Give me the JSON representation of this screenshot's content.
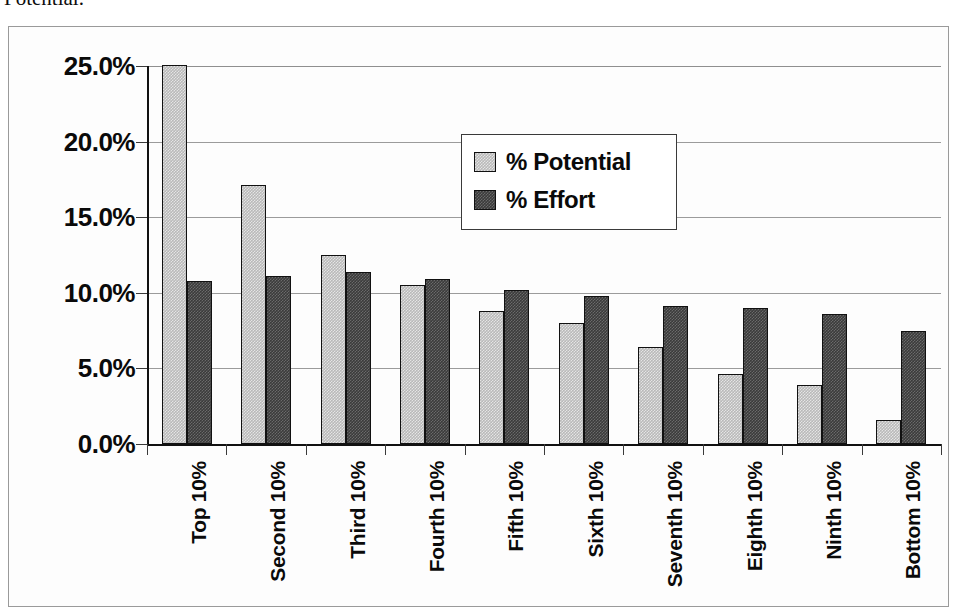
{
  "caption": {
    "text": "Potential."
  },
  "legend": {
    "position": "inside-top-center",
    "entries": [
      {
        "label": "% Potential",
        "color": "#b9b9b9",
        "swatch_name": "legend-swatch-potential"
      },
      {
        "label": "% Effort",
        "color": "#3b3b3b",
        "swatch_name": "legend-swatch-effort"
      }
    ]
  },
  "axis": {
    "y_ticks": [
      "0.0%",
      "5.0%",
      "10.0%",
      "15.0%",
      "20.0%",
      "25.0%"
    ],
    "y_tick_values": [
      0,
      5,
      10,
      15,
      20,
      25
    ]
  },
  "chart_data": {
    "type": "bar",
    "title": "",
    "subtitle": "",
    "xlabel": "",
    "ylabel": "",
    "ylim": [
      0,
      25
    ],
    "ytick_labels": [
      "0.0%",
      "5.0%",
      "10.0%",
      "15.0%",
      "20.0%",
      "25.0%"
    ],
    "ytick_values": [
      0,
      5,
      10,
      15,
      20,
      25
    ],
    "grid": true,
    "grid_axis": "y",
    "legend_position": "inside-top-center",
    "categories": [
      "Top 10%",
      "Second 10%",
      "Third 10%",
      "Fourth 10%",
      "Fifth 10%",
      "Sixth 10%",
      "Seventh 10%",
      "Eighth 10%",
      "Ninth 10%",
      "Bottom 10%"
    ],
    "series": [
      {
        "name": "% Potential",
        "color": "#b9b9b9",
        "values": [
          25.1,
          17.1,
          12.5,
          10.5,
          8.8,
          8.0,
          6.4,
          4.6,
          3.9,
          1.6
        ]
      },
      {
        "name": "% Effort",
        "color": "#3b3b3b",
        "values": [
          10.8,
          11.1,
          11.4,
          10.9,
          10.2,
          9.8,
          9.1,
          9.0,
          8.6,
          7.5
        ]
      }
    ]
  }
}
